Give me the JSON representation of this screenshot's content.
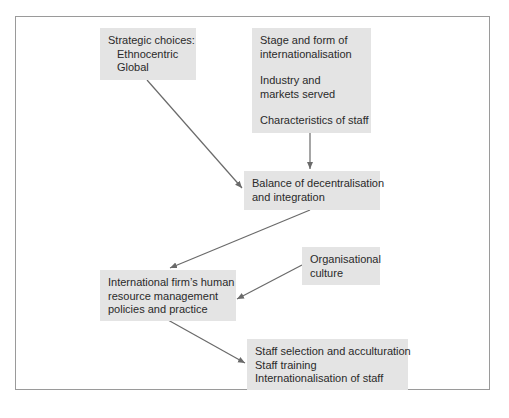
{
  "diagram": {
    "nodes": {
      "strategic_choices": {
        "title": "Strategic choices:",
        "items": [
          "Ethnocentric",
          "Global"
        ]
      },
      "contingencies": {
        "groups": [
          [
            "Stage and form of",
            "internationalisation"
          ],
          [
            "Industry and",
            "markets served"
          ],
          [
            "Characteristics of staff"
          ]
        ]
      },
      "balance": {
        "lines": [
          "Balance of decentralisation",
          "and integration"
        ]
      },
      "organisational_culture": {
        "lines": [
          "Organisational",
          "culture"
        ]
      },
      "hrm_policies": {
        "lines": [
          "International firm’s human",
          "resource management",
          "policies and practice"
        ]
      },
      "outcomes": {
        "lines": [
          "Staff selection and acculturation",
          "Staff training",
          "Internationalisation of staff"
        ]
      }
    },
    "edges": [
      {
        "from": "strategic_choices",
        "to": "balance"
      },
      {
        "from": "contingencies",
        "to": "balance"
      },
      {
        "from": "balance",
        "to": "hrm_policies"
      },
      {
        "from": "organisational_culture",
        "to": "hrm_policies"
      },
      {
        "from": "hrm_policies",
        "to": "outcomes"
      }
    ],
    "colors": {
      "box_fill": "#e4e4e4",
      "arrow": "#6a6a6a",
      "frame": "#9a9a9a",
      "text": "#2a2a2a"
    }
  }
}
